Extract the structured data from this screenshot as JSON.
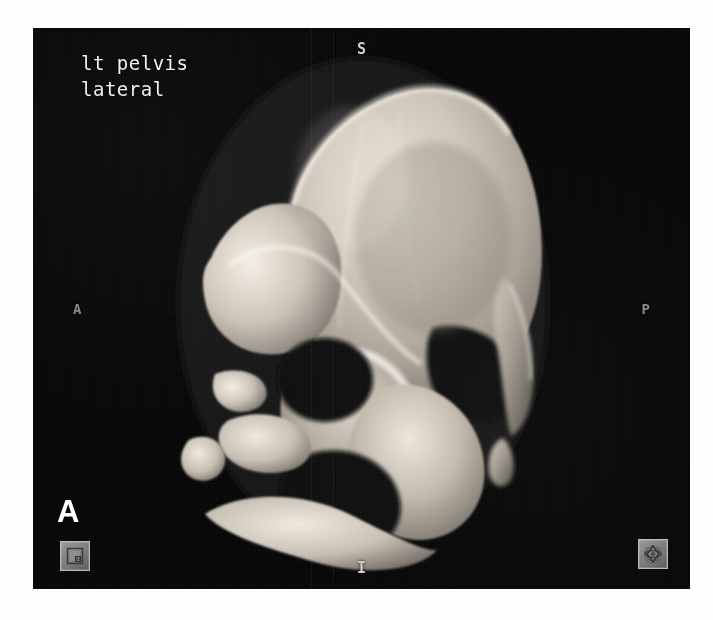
{
  "viewport": {
    "background_color": "#060607",
    "modality_note": "3D CT surface-rendered reconstruction"
  },
  "annotations": {
    "study_label_line1": "lt pelvis",
    "study_label_line2": "lateral",
    "study_label_color": "#f2f2f2"
  },
  "orientation_markers": {
    "superior": "S",
    "inferior": "I",
    "anterior": "A",
    "posterior": "P",
    "corner_letter": "A"
  },
  "tools": {
    "bottom_left": {
      "icon": "image-window-level-icon",
      "label": "Window/Level"
    },
    "bottom_right": {
      "icon": "rotate-orbit-icon",
      "label": "3D Rotate"
    }
  },
  "colors": {
    "bone_highlight": "#f4efe6",
    "bone_midtone": "#b9b1a6",
    "bone_shadow": "#6f6a63",
    "background": "#060607",
    "text": "#f2f2f2",
    "button_face": "#7b7b7b"
  }
}
